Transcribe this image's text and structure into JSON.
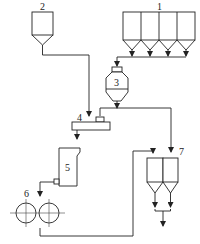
{
  "diagram": {
    "type": "process flow diagram",
    "labels": {
      "bins": "1",
      "hopper": "2",
      "mixer_vessel": "3",
      "feeder": "4",
      "chute": "5",
      "rollers": "6",
      "silos": "7"
    },
    "components": [
      {
        "id": "1",
        "name": "four-compartment storage bins"
      },
      {
        "id": "2",
        "name": "feed hopper"
      },
      {
        "id": "3",
        "name": "weighing/mixing vessel"
      },
      {
        "id": "4",
        "name": "distributor/feeder"
      },
      {
        "id": "5",
        "name": "chute/bin"
      },
      {
        "id": "6",
        "name": "roller pair"
      },
      {
        "id": "7",
        "name": "twin silos"
      }
    ],
    "colors": {
      "line": "#222222",
      "background": "#ffffff"
    }
  }
}
